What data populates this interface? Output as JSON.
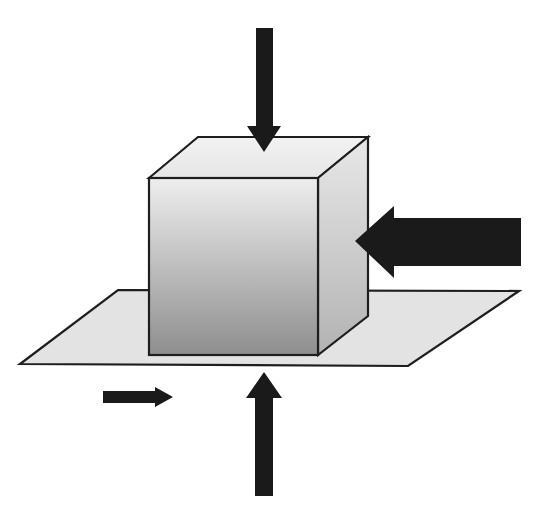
{
  "diagram": {
    "elements": {
      "plane": {
        "label": "horizontal surface",
        "fill": "#e4e4e4",
        "stroke": "#1e1e1e"
      },
      "cube": {
        "label": "block",
        "front_gradient": [
          "#eeeeee",
          "#8e8e8e"
        ],
        "top_fill": "#ececec",
        "side_gradient": [
          "#e6e6e6",
          "#b4b4b4"
        ],
        "stroke": "#1e1e1e"
      },
      "arrows": [
        {
          "id": "top-force",
          "label": "downward force on top face",
          "direction": "down",
          "size": "medium",
          "color": "#1a1a1a"
        },
        {
          "id": "side-force",
          "label": "large horizontal force on right face",
          "direction": "left",
          "size": "large",
          "color": "#1a1a1a"
        },
        {
          "id": "friction-force",
          "label": "small horizontal force along plane",
          "direction": "right",
          "size": "small",
          "color": "#1a1a1a"
        },
        {
          "id": "normal-force",
          "label": "upward force from below",
          "direction": "up",
          "size": "medium",
          "color": "#1a1a1a"
        }
      ]
    }
  }
}
